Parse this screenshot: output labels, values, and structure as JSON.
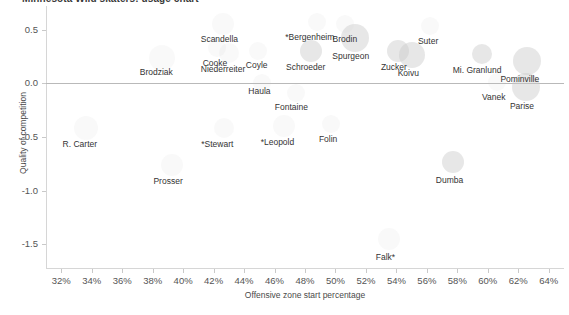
{
  "chart_data": {
    "type": "scatter",
    "title": "Minnesota Wild skaters: usage chart",
    "xlabel": "Offensive zone start percentage",
    "ylabel": "Quality of competition",
    "xlim": [
      31.0,
      65.0
    ],
    "ylim": [
      -1.72,
      0.72
    ],
    "xticks": [
      "32%",
      "34%",
      "36%",
      "38%",
      "40%",
      "42%",
      "44%",
      "46%",
      "48%",
      "50%",
      "52%",
      "54%",
      "56%",
      "58%",
      "60%",
      "62%",
      "64%"
    ],
    "xtick_values": [
      32,
      34,
      36,
      38,
      40,
      42,
      44,
      46,
      48,
      50,
      52,
      54,
      56,
      58,
      60,
      62,
      64
    ],
    "yticks": [
      "0.5",
      "0.0",
      "-0.5",
      "-1.0",
      "-1.5"
    ],
    "ytick_values": [
      0.5,
      0.0,
      -0.5,
      -1.0,
      -1.5
    ],
    "grid": false,
    "legend": null,
    "zero_reference_line": 0.0,
    "bubble_size_meaning": "time on ice",
    "points": [
      {
        "name": "Brodziak",
        "x": 38.6,
        "y": 0.24,
        "r": 13,
        "faint": true,
        "label_dx": -22,
        "label_dy": 10
      },
      {
        "name": "Scandella",
        "x": 42.6,
        "y": 0.55,
        "r": 11,
        "faint": true,
        "label_dx": -22,
        "label_dy": 11
      },
      {
        "name": "Cooke",
        "x": 42.2,
        "y": 0.33,
        "r": 9,
        "faint": true,
        "label_dx": -14,
        "label_dy": 11
      },
      {
        "name": "Niederreiter",
        "x": 43.0,
        "y": 0.28,
        "r": 10,
        "faint": true,
        "label_dx": -28,
        "label_dy": 12
      },
      {
        "name": "Coyle",
        "x": 44.9,
        "y": 0.3,
        "r": 9,
        "faint": true,
        "label_dx": -12,
        "label_dy": 10
      },
      {
        "name": "*Bergenheim",
        "x": 48.8,
        "y": 0.57,
        "r": 9,
        "faint": true,
        "label_dx": -32,
        "label_dy": 11
      },
      {
        "name": "Brodin",
        "x": 50.6,
        "y": 0.55,
        "r": 9,
        "faint": true,
        "label_dx": -12,
        "label_dy": 11
      },
      {
        "name": "Schroeder",
        "x": 48.4,
        "y": 0.3,
        "r": 11,
        "faint": false,
        "label_dx": -25,
        "label_dy": 12
      },
      {
        "name": "Spurgeon",
        "x": 51.3,
        "y": 0.42,
        "r": 14,
        "faint": false,
        "label_dx": -23,
        "label_dy": 14
      },
      {
        "name": "Suter",
        "x": 56.2,
        "y": 0.53,
        "r": 9,
        "faint": true,
        "label_dx": -12,
        "label_dy": 11
      },
      {
        "name": "Zucker",
        "x": 54.1,
        "y": 0.3,
        "r": 11,
        "faint": false,
        "label_dx": -17,
        "label_dy": 12
      },
      {
        "name": "Koivu",
        "x": 55.0,
        "y": 0.26,
        "r": 13,
        "faint": false,
        "label_dx": -14,
        "label_dy": 14
      },
      {
        "name": "Mi. Granlund",
        "x": 59.6,
        "y": 0.27,
        "r": 10,
        "faint": false,
        "label_dx": -29,
        "label_dy": 12
      },
      {
        "name": "Pominville",
        "x": 62.6,
        "y": 0.21,
        "r": 14,
        "faint": false,
        "label_dx": -27,
        "label_dy": 14
      },
      {
        "name": "Vanek",
        "x": 60.6,
        "y": 0.01,
        "r": 9,
        "faint": true,
        "label_dx": -15,
        "label_dy": 11
      },
      {
        "name": "Parise",
        "x": 62.5,
        "y": -0.03,
        "r": 14,
        "faint": false,
        "label_dx": -16,
        "label_dy": 15
      },
      {
        "name": "Haula",
        "x": 45.2,
        "y": 0.0,
        "r": 9,
        "faint": true,
        "label_dx": -14,
        "label_dy": 4
      },
      {
        "name": "Fontaine",
        "x": 47.4,
        "y": -0.09,
        "r": 9,
        "faint": true,
        "label_dx": -21,
        "label_dy": 10
      },
      {
        "name": "R. Carter",
        "x": 33.6,
        "y": -0.42,
        "r": 12,
        "faint": true,
        "label_dx": -23,
        "label_dy": 12
      },
      {
        "name": "*Stewart",
        "x": 42.7,
        "y": -0.42,
        "r": 10,
        "faint": true,
        "label_dx": -23,
        "label_dy": 12
      },
      {
        "name": "*Leopold",
        "x": 46.6,
        "y": -0.4,
        "r": 11,
        "faint": true,
        "label_dx": -23,
        "label_dy": 12
      },
      {
        "name": "Folin",
        "x": 49.7,
        "y": -0.38,
        "r": 9,
        "faint": true,
        "label_dx": -12,
        "label_dy": 11
      },
      {
        "name": "Prosser",
        "x": 39.3,
        "y": -0.76,
        "r": 11,
        "faint": true,
        "label_dx": -19,
        "label_dy": 12
      },
      {
        "name": "Dumba",
        "x": 57.7,
        "y": -0.73,
        "r": 11,
        "faint": false,
        "label_dx": -17,
        "label_dy": 14
      },
      {
        "name": "Falk*",
        "x": 53.5,
        "y": -1.45,
        "r": 11,
        "faint": true,
        "label_dx": -13,
        "label_dy": 14
      }
    ]
  },
  "colors": {
    "bubble": "#c9c9c9",
    "axis": "#d6d6d6",
    "zero_line": "#b9b9b9",
    "text": "#333333",
    "tick_text": "#555555"
  }
}
